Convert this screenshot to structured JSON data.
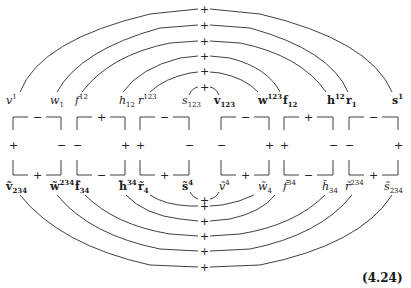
{
  "figure": {
    "equation_number": "(4.24)",
    "top_labels": [
      {
        "base": "v",
        "sup": "1",
        "sub": "",
        "frak": false,
        "x": 6
      },
      {
        "base": "w",
        "sup": "",
        "sub": "1",
        "frak": false,
        "x": 50
      },
      {
        "base": "f",
        "sup": "12",
        "sub": "",
        "frak": false,
        "x": 75
      },
      {
        "base": "h",
        "sup": "",
        "sub": "12",
        "frak": false,
        "x": 119
      },
      {
        "base": "r",
        "sup": "123",
        "sub": "",
        "frak": false,
        "x": 138
      },
      {
        "base": "s",
        "sup": "",
        "sub": "123",
        "frak": false,
        "x": 182
      },
      {
        "base": "v",
        "sup": "",
        "sub": "123",
        "frak": true,
        "x": 214
      },
      {
        "base": "w",
        "sup": "123",
        "sub": "",
        "frak": true,
        "x": 258
      },
      {
        "base": "f",
        "sup": "",
        "sub": "12",
        "frak": true,
        "x": 283
      },
      {
        "base": "h",
        "sup": "12",
        "sub": "",
        "frak": true,
        "x": 327
      },
      {
        "base": "r",
        "sup": "",
        "sub": "1",
        "frak": true,
        "x": 346
      },
      {
        "base": "s",
        "sup": "1",
        "sub": "",
        "frak": true,
        "x": 392
      }
    ],
    "bottom_labels": [
      {
        "base": "ṽ",
        "sup": "",
        "sub": "234",
        "frak": true,
        "x": 6
      },
      {
        "base": "w̃",
        "sup": "234",
        "sub": "",
        "frak": true,
        "x": 50
      },
      {
        "base": "f̃",
        "sup": "",
        "sub": "34",
        "frak": true,
        "x": 75
      },
      {
        "base": "h̃",
        "sup": "34",
        "sub": "",
        "frak": true,
        "x": 119
      },
      {
        "base": "r̃",
        "sup": "",
        "sub": "4",
        "frak": true,
        "x": 138
      },
      {
        "base": "s̃",
        "sup": "4",
        "sub": "",
        "frak": true,
        "x": 182
      },
      {
        "base": "ṽ",
        "sup": "4",
        "sub": "",
        "frak": false,
        "x": 219
      },
      {
        "base": "w̃",
        "sup": "",
        "sub": "4",
        "frak": false,
        "x": 258
      },
      {
        "base": "f̃",
        "sup": "34",
        "sub": "",
        "frak": false,
        "x": 283
      },
      {
        "base": "h̃",
        "sup": "",
        "sub": "34",
        "frak": false,
        "x": 322
      },
      {
        "base": "r̃",
        "sup": "234",
        "sub": "",
        "frak": false,
        "x": 345
      },
      {
        "base": "s̃",
        "sup": "",
        "sub": "234",
        "frak": false,
        "x": 384
      }
    ],
    "boxes": [
      {
        "x0": 13,
        "x1": 61,
        "top": "−",
        "left": "+",
        "right": "−",
        "bottom": "+"
      },
      {
        "x0": 77,
        "x1": 125,
        "top": "+",
        "left": "−",
        "right": "+",
        "bottom": "−"
      },
      {
        "x0": 140,
        "x1": 189,
        "top": "−",
        "left": "+",
        "right": "−",
        "bottom": "+"
      },
      {
        "x0": 221,
        "x1": 269,
        "top": "−",
        "left": "−",
        "right": "+",
        "bottom": "+"
      },
      {
        "x0": 284,
        "x1": 333,
        "top": "+",
        "left": "+",
        "right": "−",
        "bottom": "−"
      },
      {
        "x0": 349,
        "x1": 398,
        "top": "−",
        "left": "−",
        "right": "+",
        "bottom": "+"
      }
    ],
    "top_arc_signs": [
      "+",
      "+",
      "+",
      "+",
      "+",
      "+"
    ],
    "bottom_arc_signs": [
      "+",
      "+",
      "+",
      "+",
      "+",
      "+"
    ]
  }
}
